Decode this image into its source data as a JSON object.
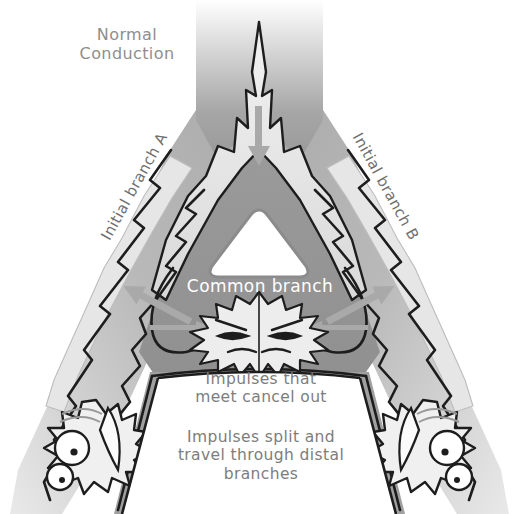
{
  "figure": {
    "title": "Normal Conduction",
    "background_color": "#ffffff"
  },
  "labels": {
    "normal_conduction": "Normal\nConduction",
    "initial_branch_a": "Initial branch A",
    "initial_branch_b": "Initial branch B",
    "common_branch": "Common branch",
    "impulses_cancel": "Impulses that\nmeet cancel out",
    "impulses_split": "Impulses split and\ntravel through distal\nbranches"
  },
  "colors": {
    "tissue_mid_gray": "#9d9d9d",
    "tissue_light_gray": "#cfcfcf",
    "impulse_pale": "#e2e2e2",
    "outline_black": "#1d1d1d",
    "arrow_gray": "#a9a9a9",
    "label_gray": "#7d7d7d",
    "label_white": "#ffffff",
    "triangle_white": "#ffffff"
  },
  "arrows": [
    {
      "name": "trunk-downward-arrow",
      "direction": "down",
      "meaning": "incoming impulse down main trunk"
    },
    {
      "name": "left-branch-arrow",
      "direction": "down-left",
      "meaning": "impulse travels down initial branch A"
    },
    {
      "name": "right-branch-arrow",
      "direction": "down-right",
      "meaning": "impulse travels down initial branch B"
    },
    {
      "name": "collision-arrow-left",
      "direction": "right",
      "meaning": "impulse arriving from branch A"
    },
    {
      "name": "collision-arrow-right",
      "direction": "left",
      "meaning": "impulse arriving from branch B"
    }
  ],
  "annotations": {
    "collision_burst": "two impulses colliding and cancelling",
    "distal_terminal_left": "distal branch terminal A",
    "distal_terminal_right": "distal branch terminal B",
    "central_triangle": "common branch lumen"
  }
}
